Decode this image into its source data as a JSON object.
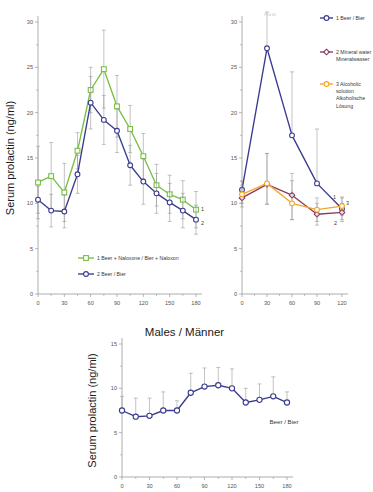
{
  "figure": {
    "panels": [
      "females-naloxone-panel",
      "beverage-comparison-panel",
      "males-panel"
    ]
  },
  "panel_left": {
    "ylabel": "Serum prolactin (ng/ml)",
    "yticks": [
      "0",
      "5",
      "10",
      "15",
      "20",
      "25",
      "30"
    ],
    "xticks": [
      "0",
      "30",
      "60",
      "90",
      "120",
      "150",
      "180"
    ],
    "legend": [
      {
        "key": "1",
        "label": "1 Beer + Naloxone / Bier + Naloxon",
        "color": "#77c043"
      },
      {
        "key": "2",
        "label": "2 Beer / Bier",
        "color": "#3b3b8f"
      }
    ],
    "endpoint_labels": [
      "1",
      "2"
    ]
  },
  "panel_right": {
    "yticks": [
      "0",
      "5",
      "10",
      "15",
      "20",
      "25",
      "30"
    ],
    "xticks": [
      "0",
      "30",
      "60",
      "90",
      "120"
    ],
    "significance_note": "P<0.05",
    "legend": [
      {
        "key": "1",
        "label": "1 Beer / Bier",
        "color": "#3b3b8f"
      },
      {
        "key": "2",
        "label": "2 Mineral water / Mineralwasser",
        "color": "#8b3a62"
      },
      {
        "key": "3",
        "label": "3 Alcoholic solution / Alkoholische Lösung",
        "color": "#f5a623"
      }
    ],
    "endpoint_labels": [
      "1",
      "2",
      "3"
    ]
  },
  "panel_bottom": {
    "title": "Males / Männer",
    "ylabel": "Serum prolactin (ng/ml)",
    "yticks": [
      "0",
      "5",
      "10",
      "15"
    ],
    "xticks": [
      "0",
      "30",
      "60",
      "90",
      "120",
      "150",
      "180"
    ],
    "annotation": "Beer / Bier"
  },
  "chart_data": [
    {
      "type": "line",
      "name": "females-naloxone-panel",
      "title": "",
      "xlabel": "",
      "ylabel": "Serum prolactin (ng/ml)",
      "xlim": [
        0,
        180
      ],
      "ylim": [
        0,
        30
      ],
      "xticks": [
        0,
        30,
        60,
        90,
        120,
        150,
        180
      ],
      "yticks": [
        0,
        5,
        10,
        15,
        20,
        25,
        30
      ],
      "grid": false,
      "legend_position": "bottom-center",
      "errorbars": "SEM",
      "x": [
        0,
        15,
        30,
        45,
        60,
        75,
        90,
        105,
        120,
        135,
        150,
        165,
        180
      ],
      "series": [
        {
          "name": "1 Beer + Naloxone / Bier + Naloxon",
          "color": "#77c043",
          "marker": "square",
          "values": [
            12.3,
            13.0,
            11.2,
            15.8,
            22.5,
            24.8,
            20.7,
            18.2,
            15.2,
            12.0,
            11.0,
            10.4,
            9.3
          ],
          "err_up": [
            4.0,
            3.7,
            3.2,
            2.0,
            2.5,
            4.3,
            3.4,
            2.6,
            2.5,
            2.3,
            2.1,
            2.1,
            2.0
          ],
          "err_dn": [
            4.0,
            3.7,
            3.2,
            2.0,
            2.5,
            4.3,
            3.4,
            2.6,
            2.5,
            2.3,
            2.1,
            2.1,
            2.0
          ]
        },
        {
          "name": "2 Beer / Bier",
          "color": "#3b3b8f",
          "marker": "circle",
          "values": [
            10.4,
            9.2,
            9.1,
            13.2,
            21.1,
            19.2,
            18.0,
            14.2,
            12.4,
            11.1,
            10.1,
            9.2,
            8.2
          ],
          "err_up": [
            1.5,
            1.8,
            1.8,
            2.1,
            2.9,
            2.7,
            2.4,
            2.2,
            2.5,
            2.2,
            2.1,
            1.9,
            1.6
          ],
          "err_dn": [
            1.5,
            1.8,
            1.8,
            2.1,
            2.9,
            2.7,
            2.4,
            2.2,
            2.5,
            2.2,
            2.1,
            1.9,
            1.6
          ]
        }
      ]
    },
    {
      "type": "line",
      "name": "beverage-comparison-panel",
      "title": "",
      "xlabel": "",
      "ylabel": "",
      "xlim": [
        0,
        120
      ],
      "ylim": [
        0,
        30
      ],
      "xticks": [
        0,
        30,
        60,
        90,
        120
      ],
      "yticks": [
        0,
        5,
        10,
        15,
        20,
        25,
        30
      ],
      "grid": false,
      "legend_position": "right",
      "errorbars": "SEM",
      "annotations": [
        "P<0.05"
      ],
      "x": [
        0,
        30,
        60,
        90,
        120
      ],
      "series": [
        {
          "name": "1 Beer / Bier",
          "color": "#3b3b8f",
          "marker": "circle",
          "values": [
            11.5,
            27.1,
            17.5,
            12.2,
            9.4
          ],
          "err_up": [
            0.9,
            4.0,
            7.0,
            6.0,
            1.2
          ],
          "err_dn": [
            0.9,
            0.0,
            0.0,
            0.0,
            1.2
          ]
        },
        {
          "name": "2 Mineral water / Mineralwasser",
          "color": "#8b3a62",
          "marker": "diamond",
          "values": [
            10.6,
            12.1,
            10.9,
            8.8,
            9.0
          ],
          "err_up": [
            1.0,
            3.4,
            2.4,
            1.2,
            1.0
          ],
          "err_dn": [
            1.0,
            2.2,
            2.7,
            1.2,
            1.0
          ]
        },
        {
          "name": "3 Alcoholic solution / Alkoholische Lösung",
          "color": "#f5a623",
          "marker": "circle",
          "values": [
            11.0,
            12.2,
            10.0,
            9.3,
            9.7
          ],
          "err_up": [
            1.0,
            3.3,
            2.5,
            1.3,
            1.0
          ],
          "err_dn": [
            1.0,
            2.3,
            1.8,
            1.3,
            1.0
          ]
        }
      ]
    },
    {
      "type": "line",
      "name": "males-panel",
      "title": "Males / Männer",
      "xlabel": "",
      "ylabel": "Serum prolactin (ng/ml)",
      "xlim": [
        0,
        180
      ],
      "ylim": [
        0,
        15
      ],
      "xticks": [
        0,
        30,
        60,
        90,
        120,
        150,
        180
      ],
      "yticks": [
        0,
        5,
        10,
        15
      ],
      "grid": false,
      "legend_position": "none",
      "errorbars": "SEM",
      "annotations": [
        "Beer / Bier"
      ],
      "x": [
        0,
        15,
        30,
        45,
        60,
        75,
        90,
        105,
        120,
        135,
        150,
        165,
        180
      ],
      "series": [
        {
          "name": "Beer / Bier",
          "color": "#3b3b8f",
          "marker": "circle",
          "values": [
            7.5,
            6.8,
            6.9,
            7.5,
            7.5,
            9.5,
            10.2,
            10.35,
            10.0,
            8.4,
            8.7,
            9.1,
            8.4
          ],
          "err_up": [
            1.6,
            2.1,
            2.0,
            2.1,
            1.1,
            2.2,
            2.1,
            2.0,
            2.2,
            1.6,
            1.8,
            2.2,
            1.2
          ],
          "err_dn": [
            0.0,
            0.0,
            0.0,
            0.0,
            0.0,
            0.0,
            0.0,
            0.0,
            0.0,
            0.0,
            0.0,
            0.0,
            0.0
          ]
        }
      ]
    }
  ]
}
